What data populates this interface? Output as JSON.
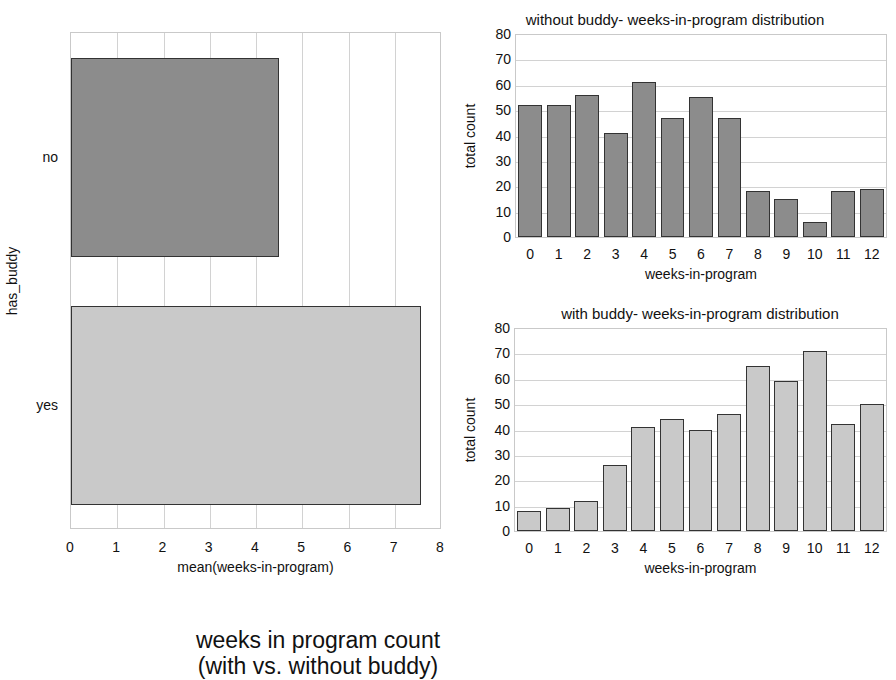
{
  "chart_data": [
    {
      "type": "bar",
      "orientation": "horizontal",
      "title": "",
      "categories": [
        "no",
        "yes"
      ],
      "values": [
        4.5,
        7.57
      ],
      "xlabel": "mean(weeks-in-program)",
      "ylabel": "has_buddy",
      "xlim": [
        0,
        8
      ],
      "xticks": [
        0,
        1,
        2,
        3,
        4,
        5,
        6,
        7,
        8
      ],
      "grid": true,
      "colors": [
        "#8c8c8c",
        "#c9c9c9"
      ]
    },
    {
      "type": "bar",
      "title": "without buddy- weeks-in-program distribution",
      "categories": [
        "0",
        "1",
        "2",
        "3",
        "4",
        "5",
        "6",
        "7",
        "8",
        "9",
        "10",
        "11",
        "12"
      ],
      "values": [
        52,
        52,
        56,
        41,
        61,
        47,
        55,
        47,
        18,
        15,
        6,
        18,
        19
      ],
      "xlabel": "weeks-in-program",
      "ylabel": "total count",
      "ylim": [
        0,
        80
      ],
      "yticks": [
        0,
        10,
        20,
        30,
        40,
        50,
        60,
        70,
        80
      ],
      "grid": true,
      "color": "#8c8c8c"
    },
    {
      "type": "bar",
      "title": "with buddy- weeks-in-program distribution",
      "categories": [
        "0",
        "1",
        "2",
        "3",
        "4",
        "5",
        "6",
        "7",
        "8",
        "9",
        "10",
        "11",
        "12"
      ],
      "values": [
        8,
        9,
        12,
        26,
        41,
        44,
        40,
        46,
        65,
        59,
        71,
        42,
        50
      ],
      "xlabel": "weeks-in-program",
      "ylabel": "total count",
      "ylim": [
        0,
        80
      ],
      "yticks": [
        0,
        10,
        20,
        30,
        40,
        50,
        60,
        70,
        80
      ],
      "grid": true,
      "color": "#c9c9c9"
    }
  ],
  "figure": {
    "title_line1": "weeks in program count",
    "title_line2": "(with vs. without buddy)"
  },
  "layout": {
    "left": {
      "x": 70,
      "y": 32,
      "w": 371,
      "h": 497,
      "bands": [
        [
          57,
          256
        ],
        [
          305,
          504
        ]
      ]
    },
    "top": {
      "x": 515,
      "y": 34,
      "w": 372,
      "h": 204,
      "title_x": 675,
      "title_y": 11
    },
    "bottom": {
      "x": 514,
      "y": 328,
      "w": 373,
      "h": 204,
      "title_x": 700,
      "title_y": 305
    }
  }
}
